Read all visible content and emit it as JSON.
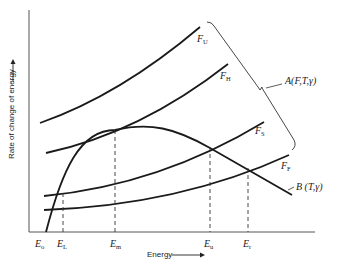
{
  "diagram": {
    "x_axis_title": "Energy",
    "y_axis_title": "Rate of change of energy",
    "curves": [
      {
        "id": "FU",
        "main": "F",
        "sub": "U"
      },
      {
        "id": "FH",
        "main": "F",
        "sub": "H"
      },
      {
        "id": "FS",
        "main": "F",
        "sub": "S"
      },
      {
        "id": "FF",
        "main": "F",
        "sub": "F"
      }
    ],
    "brace_label": "A(F,T,γ)",
    "loss_curve_label": "B (T,γ)",
    "x_ticks": [
      {
        "main": "E",
        "sub": "o"
      },
      {
        "main": "E",
        "sub": "L"
      },
      {
        "main": "E",
        "sub": "m"
      },
      {
        "main": "E",
        "sub": "u"
      },
      {
        "main": "E",
        "sub": "r"
      }
    ],
    "colors": {
      "line": "#1a1a1a",
      "text": "#222222",
      "background": "#ffffff"
    }
  }
}
